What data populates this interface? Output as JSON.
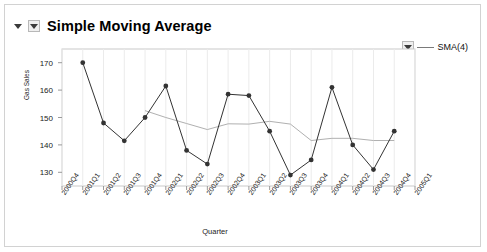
{
  "header": {
    "title": "Simple Moving Average",
    "collapse_icon": "triangle-down-icon",
    "menu_icon": "triangle-down-icon"
  },
  "legend": {
    "dropdown_icon": "triangle-down-icon",
    "entries": [
      {
        "label": "SMA(4)",
        "color": "#7a7a7a",
        "marker": "line"
      }
    ]
  },
  "chart_data": {
    "type": "line",
    "title": "Simple Moving Average",
    "xlabel": "Quarter",
    "ylabel": "Gas Sales",
    "ylim": [
      125,
      175
    ],
    "yticks": [
      130,
      140,
      150,
      160,
      170
    ],
    "grid": true,
    "legend_position": "top-right",
    "categories": [
      "2000Q4",
      "2001Q1",
      "2001Q2",
      "2001Q3",
      "2001Q4",
      "2002Q1",
      "2002Q2",
      "2002Q3",
      "2002Q4",
      "2003Q1",
      "2003Q2",
      "2003Q3",
      "2003Q4",
      "2004Q1",
      "2004Q2",
      "2004Q3",
      "2004Q4",
      "2005Q1"
    ],
    "series": [
      {
        "name": "Gas Sales",
        "color": "#333333",
        "marker": "circle",
        "values": [
          null,
          170.0,
          148.0,
          141.5,
          150.0,
          161.5,
          138.0,
          133.0,
          158.5,
          158.0,
          145.0,
          129.0,
          134.5,
          161.0,
          140.0,
          131.0,
          145.0,
          null
        ]
      },
      {
        "name": "SMA(4)",
        "color": "#b0b0b0",
        "marker": "none",
        "values": [
          null,
          null,
          null,
          null,
          152.5,
          150.0,
          147.8,
          145.6,
          147.7,
          147.6,
          148.6,
          147.6,
          141.6,
          142.4,
          142.4,
          141.6,
          141.6,
          null
        ]
      }
    ]
  }
}
